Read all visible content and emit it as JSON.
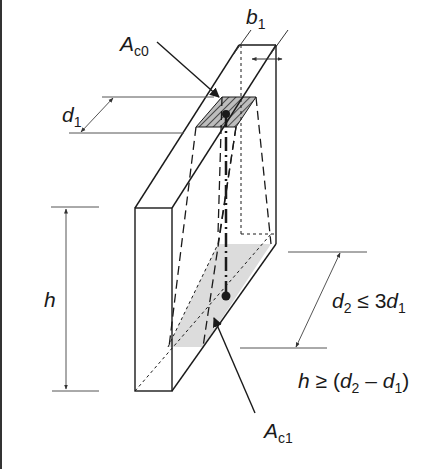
{
  "figure": {
    "labels": {
      "ac0": {
        "main": "A",
        "sub": "c0"
      },
      "ac1": {
        "main": "A",
        "sub": "c1"
      },
      "b1": {
        "main": "b",
        "sub": "1"
      },
      "d1": {
        "main": "d",
        "sub": "1"
      },
      "h": {
        "main": "h"
      },
      "d2_condition": {
        "d": "d",
        "sub2": "2",
        "rel": " ≤ 3",
        "d1": "d",
        "sub1": "1"
      },
      "h_condition": {
        "h": "h",
        "rel": " ≥ (",
        "d2": "d",
        "sub2": "2",
        "minus": " – ",
        "d1": "d",
        "sub1": "1",
        "close": ")"
      }
    },
    "colors": {
      "line": "#1a1a1a",
      "dim_line": "#555555",
      "hatch_fill": "#9a9a9a",
      "grey_area": "#dcdcdc",
      "border": "#333333"
    }
  }
}
